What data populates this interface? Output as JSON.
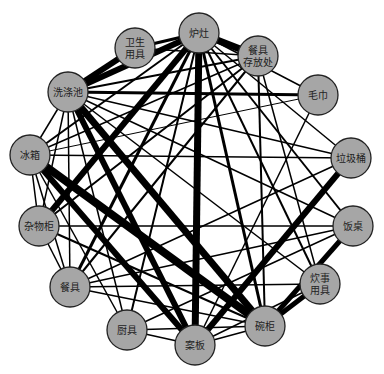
{
  "diagram": {
    "type": "network",
    "node_fill": "#a6a6a6",
    "node_stroke": "#222222",
    "edge_color": "#000000",
    "node_radius": 20,
    "nodes": [
      {
        "id": "luzao",
        "label": [
          "炉灶"
        ],
        "x": 199,
        "y": 33
      },
      {
        "id": "weisheng",
        "label": [
          "卫生",
          "用具"
        ],
        "x": 135,
        "y": 48
      },
      {
        "id": "canjucunfang",
        "label": [
          "餐具",
          "存放处"
        ],
        "x": 258,
        "y": 56
      },
      {
        "id": "xidichi",
        "label": [
          "洗涤池"
        ],
        "x": 68,
        "y": 92
      },
      {
        "id": "maojin",
        "label": [
          "毛巾"
        ],
        "x": 318,
        "y": 95
      },
      {
        "id": "bingxiang",
        "label": [
          "冰箱"
        ],
        "x": 30,
        "y": 155
      },
      {
        "id": "lajitong",
        "label": [
          "垃圾桶"
        ],
        "x": 351,
        "y": 158
      },
      {
        "id": "zawugui",
        "label": [
          "杂物柜"
        ],
        "x": 39,
        "y": 226
      },
      {
        "id": "fanzhuo",
        "label": [
          "饭桌"
        ],
        "x": 353,
        "y": 226
      },
      {
        "id": "canju",
        "label": [
          "餐具"
        ],
        "x": 70,
        "y": 287
      },
      {
        "id": "chuishi",
        "label": [
          "炊事",
          "用具"
        ],
        "x": 320,
        "y": 284
      },
      {
        "id": "chuju",
        "label": [
          "厨具"
        ],
        "x": 127,
        "y": 330
      },
      {
        "id": "wangui",
        "label": [
          "碗柜"
        ],
        "x": 265,
        "y": 326
      },
      {
        "id": "anban",
        "label": [
          "案板"
        ],
        "x": 195,
        "y": 345
      }
    ],
    "edges": [
      [
        "luzao",
        "canjucunfang",
        7
      ],
      [
        "luzao",
        "xidichi",
        6
      ],
      [
        "luzao",
        "anban",
        7
      ],
      [
        "luzao",
        "zawugui",
        6
      ],
      [
        "luzao",
        "weisheng",
        3
      ],
      [
        "luzao",
        "bingxiang",
        2
      ],
      [
        "luzao",
        "maojin",
        1.5
      ],
      [
        "luzao",
        "lajitong",
        1.5
      ],
      [
        "luzao",
        "fanzhuo",
        2
      ],
      [
        "luzao",
        "chuishi",
        2
      ],
      [
        "luzao",
        "wangui",
        3
      ],
      [
        "luzao",
        "canju",
        3
      ],
      [
        "luzao",
        "chuju",
        2
      ],
      [
        "weisheng",
        "xidichi",
        6
      ],
      [
        "weisheng",
        "canjucunfang",
        1.5
      ],
      [
        "canjucunfang",
        "xidichi",
        2
      ],
      [
        "canjucunfang",
        "zawugui",
        2
      ],
      [
        "canjucunfang",
        "canju",
        2
      ],
      [
        "canjucunfang",
        "wangui",
        2
      ],
      [
        "canjucunfang",
        "chuishi",
        1.5
      ],
      [
        "canjucunfang",
        "bingxiang",
        1.5
      ],
      [
        "xidichi",
        "maojin",
        3
      ],
      [
        "xidichi",
        "wangui",
        7
      ],
      [
        "xidichi",
        "anban",
        6
      ],
      [
        "xidichi",
        "zawugui",
        1.5
      ],
      [
        "xidichi",
        "bingxiang",
        1.5
      ],
      [
        "xidichi",
        "canju",
        1.5
      ],
      [
        "xidichi",
        "chuju",
        1.5
      ],
      [
        "xidichi",
        "lajitong",
        1.5
      ],
      [
        "xidichi",
        "fanzhuo",
        1.5
      ],
      [
        "xidichi",
        "chuishi",
        1.5
      ],
      [
        "maojin",
        "anban",
        1.5
      ],
      [
        "maojin",
        "bingxiang",
        1
      ],
      [
        "bingxiang",
        "wangui",
        8
      ],
      [
        "bingxiang",
        "anban",
        6
      ],
      [
        "bingxiang",
        "zawugui",
        1.5
      ],
      [
        "bingxiang",
        "lajitong",
        1.5
      ],
      [
        "bingxiang",
        "chuju",
        1.5
      ],
      [
        "bingxiang",
        "canju",
        1.5
      ],
      [
        "lajitong",
        "anban",
        6
      ],
      [
        "lajitong",
        "canju",
        1.5
      ],
      [
        "zawugui",
        "fanzhuo",
        1.5
      ],
      [
        "zawugui",
        "canju",
        1.5
      ],
      [
        "zawugui",
        "wangui",
        2
      ],
      [
        "fanzhuo",
        "wangui",
        5
      ],
      [
        "fanzhuo",
        "canju",
        1.5
      ],
      [
        "fanzhuo",
        "chuju",
        1.5
      ],
      [
        "canju",
        "chuishi",
        1.5
      ],
      [
        "canju",
        "wangui",
        1.5
      ],
      [
        "chuishi",
        "wangui",
        5
      ],
      [
        "chuishi",
        "anban",
        1.5
      ],
      [
        "chuju",
        "anban",
        1.5
      ],
      [
        "chuju",
        "wangui",
        1.5
      ],
      [
        "wangui",
        "anban",
        1.5
      ]
    ]
  }
}
